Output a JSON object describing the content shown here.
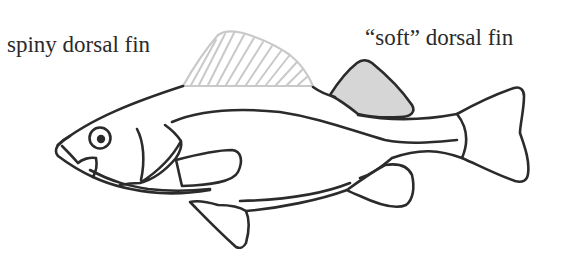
{
  "diagram": {
    "labels": {
      "spiny_dorsal_fin": "spiny dorsal fin",
      "soft_dorsal_fin": "“soft” dorsal fin"
    },
    "colors": {
      "outline": "#2b2b2b",
      "spiny_fin_hatch": "#c9c9c9",
      "soft_fin_fill": "#d6d6d6",
      "background": "#ffffff",
      "label_text": "#2a2a2a"
    },
    "parts": [
      "spiny dorsal fin",
      "soft dorsal fin",
      "head",
      "eye",
      "mouth",
      "gill cover",
      "pectoral fin",
      "pelvic fin",
      "anal fin",
      "lateral line",
      "caudal fin"
    ]
  }
}
